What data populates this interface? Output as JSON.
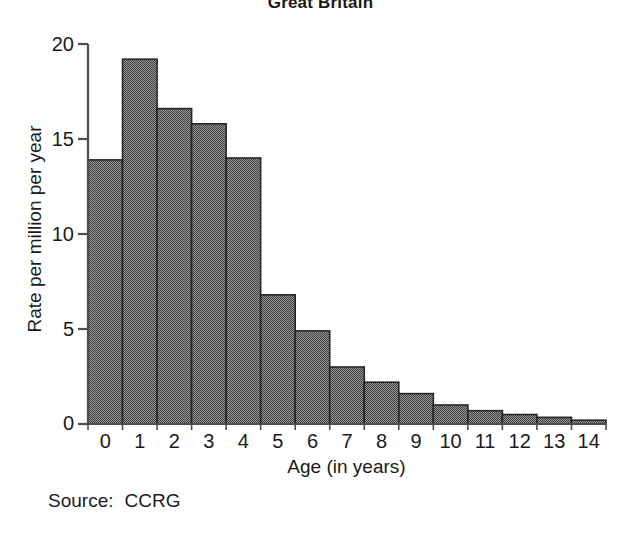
{
  "chart_data": {
    "type": "bar",
    "title": "Great Britain",
    "xlabel": "Age (in years)",
    "ylabel": "Rate per million per year",
    "categories": [
      "0",
      "1",
      "2",
      "3",
      "4",
      "5",
      "6",
      "7",
      "8",
      "9",
      "10",
      "11",
      "12",
      "13",
      "14"
    ],
    "values": [
      13.9,
      19.2,
      16.6,
      15.8,
      14.0,
      6.8,
      4.9,
      3.0,
      2.2,
      1.6,
      1.0,
      0.7,
      0.5,
      0.35,
      0.2
    ],
    "yticks": [
      "0",
      "5",
      "10",
      "15",
      "20"
    ],
    "ytick_values": [
      0,
      5,
      10,
      15,
      20
    ],
    "ylim": [
      0,
      20
    ],
    "grid": false,
    "legend": "none",
    "bar_fill": "#6e6e6e",
    "bar_edge": "#262626",
    "axis_color": "#4d4d4d"
  },
  "footer": {
    "source_label": "Source:",
    "source_value": "CCRG"
  }
}
